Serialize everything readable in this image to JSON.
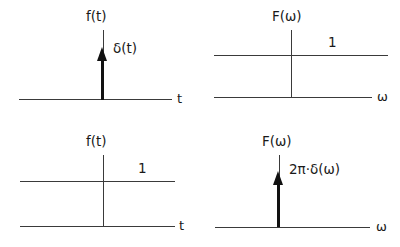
{
  "figure": {
    "line_color": "#3a3a3a",
    "impulse_color": "#111111"
  },
  "panels": [
    {
      "id": "time-impulse",
      "vertical_axis_label": "f(t)",
      "horizontal_axis_label": "t",
      "impulse_label": "δ(t)",
      "amplitude_label": ""
    },
    {
      "id": "freq-constant",
      "vertical_axis_label": "F(ω)",
      "horizontal_axis_label": "ω",
      "impulse_label": "",
      "amplitude_label": "1"
    },
    {
      "id": "time-constant",
      "vertical_axis_label": "f(t)",
      "horizontal_axis_label": "t",
      "impulse_label": "",
      "amplitude_label": "1"
    },
    {
      "id": "freq-impulse",
      "vertical_axis_label": "F(ω)",
      "horizontal_axis_label": "ω",
      "impulse_label": "2π·δ(ω)",
      "amplitude_label": ""
    }
  ]
}
